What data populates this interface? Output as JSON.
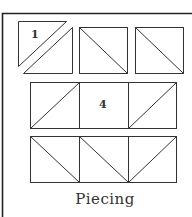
{
  "figure": {
    "caption": "Piecing",
    "labels": {
      "tile1": "1",
      "tile4": "4"
    },
    "colors": {
      "line": "#333333",
      "frame": "#222222",
      "background": "#ffffff"
    },
    "rows": [
      {
        "row": 1,
        "tiles": [
          "split-diagonal-exploded",
          "diagonal-down",
          "diagonal-down"
        ]
      },
      {
        "row": 2,
        "tiles": [
          "diagonal-up",
          "plain",
          "diagonal-up"
        ]
      },
      {
        "row": 3,
        "tiles": [
          "diagonal-down",
          "diagonal-down",
          "diagonal-up"
        ]
      }
    ]
  }
}
